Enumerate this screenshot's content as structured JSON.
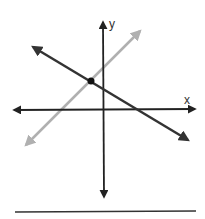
{
  "diagram": {
    "type": "coordinate-plane-two-lines",
    "axes": {
      "x_label": "x",
      "y_label": "y",
      "color": "#222222"
    },
    "lines": [
      {
        "name": "dark-line",
        "color": "#333333",
        "slope_sign": "negative",
        "x1": 33,
        "y1": 47,
        "x2": 188,
        "y2": 140
      },
      {
        "name": "gray-line",
        "color": "#b0b0b0",
        "slope_sign": "positive",
        "x1": 26,
        "y1": 145,
        "x2": 140,
        "y2": 31
      }
    ],
    "intersection_point": {
      "x": 91,
      "y": 81,
      "quadrant": "II"
    },
    "answer_line": {
      "color": "#333333"
    }
  }
}
